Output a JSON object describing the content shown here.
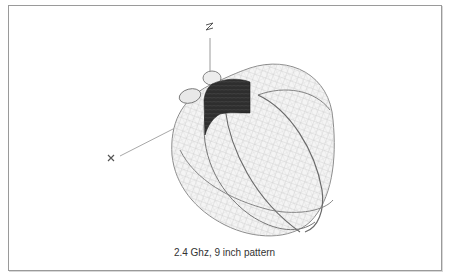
{
  "figure": {
    "caption": "2.4 Ghz,  9 inch pattern",
    "axes": {
      "z_label": "z",
      "x_label": "x"
    },
    "colors": {
      "mesh": "#b8b8b8",
      "outline": "#6a6a6a",
      "dark_patch": "#2e2e2e",
      "axis": "#9a9a9a",
      "border": "#9a9a9a"
    }
  }
}
